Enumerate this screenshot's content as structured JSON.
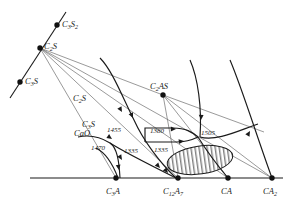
{
  "figure": {
    "type": "phase-diagram",
    "title": "",
    "background": "#ffffff",
    "ink_color": "#1a1a1a",
    "ray_color": "#6f6f6f",
    "size": {
      "width": 287,
      "height": 205
    }
  },
  "points": [
    {
      "id": "c3s2",
      "label": "C",
      "sub1": "3",
      "mid": "S",
      "sub2": "2",
      "x": 57,
      "y": 25,
      "label_x": 62,
      "label_y": 27
    },
    {
      "id": "c2s",
      "label": "C",
      "sub1": "2",
      "mid": "S",
      "sub2": "",
      "x": 40,
      "y": 48,
      "label_x": 44,
      "label_y": 49
    },
    {
      "id": "c3s",
      "label": "C",
      "sub1": "3",
      "mid": "S",
      "sub2": "",
      "x": 20,
      "y": 82,
      "label_x": 25,
      "label_y": 84
    },
    {
      "id": "c2as",
      "label": "C",
      "sub1": "2",
      "mid": "AS",
      "sub2": "",
      "x": 163,
      "y": 95,
      "label_x": 150,
      "label_y": 89
    },
    {
      "id": "c3a",
      "label": "C",
      "sub1": "3",
      "mid": "A",
      "sub2": "",
      "x": 116,
      "y": 178,
      "label_x": 106,
      "label_y": 194
    },
    {
      "id": "c12a7",
      "label": "C",
      "sub1": "12",
      "mid": "A",
      "sub2": "7",
      "x": 178,
      "y": 178,
      "label_x": 163,
      "label_y": 194
    },
    {
      "id": "ca",
      "label": "C",
      "sub1": "",
      "mid": "A",
      "sub2": "",
      "x": 228,
      "y": 178,
      "label_x": 221,
      "label_y": 194
    },
    {
      "id": "ca2",
      "label": "C",
      "sub1": "",
      "mid": "A",
      "sub2": "2",
      "x": 272,
      "y": 178,
      "label_x": 263,
      "label_y": 194
    }
  ],
  "floating_labels": [
    {
      "id": "c2s-field",
      "text": "C2S",
      "base": "C",
      "sub": "2",
      "tail": "S",
      "x": 73,
      "y": 101
    },
    {
      "id": "c3s-field",
      "text": "C3S",
      "base": "C",
      "sub": "3",
      "tail": "S",
      "x": 82,
      "y": 127
    },
    {
      "id": "cao-field",
      "text": "CaO",
      "base": "CaO",
      "sub": "",
      "tail": "",
      "x": 74,
      "y": 136
    }
  ],
  "temperatures": [
    {
      "id": "t1455",
      "value": "1455",
      "x": 107,
      "y": 132
    },
    {
      "id": "t1470",
      "value": "1470",
      "x": 91,
      "y": 150
    },
    {
      "id": "t1335a",
      "value": "1335",
      "x": 124,
      "y": 153
    },
    {
      "id": "t1380",
      "value": "1380",
      "x": 150,
      "y": 133
    },
    {
      "id": "t1335b",
      "value": "1335",
      "x": 154,
      "y": 152
    },
    {
      "id": "t1505",
      "value": "1505",
      "x": 201,
      "y": 135
    }
  ],
  "axis": {
    "id": "baseline",
    "x1": 30,
    "y1": 178,
    "x2": 283,
    "y2": 178
  },
  "hatched_region": {
    "id": "immiscibility-field",
    "cx": 200,
    "cy": 160,
    "rx": 33,
    "ry": 14,
    "rotation": -8,
    "hatch": "vertical"
  },
  "boundary_curves": [
    {
      "id": "curve-cao-left",
      "d": "M 78 137 C 92 134 102 138 110 143 C 117 148 119 160 120 178"
    },
    {
      "id": "curve-1470-branch",
      "d": "M 96 148 C 104 152 112 162 118 178"
    },
    {
      "id": "curve-c2s-down",
      "d": "M 100 58 C 112 70 122 96 134 120 C 143 140 160 163 176 178"
    },
    {
      "id": "curve-c3s-to-c12a7",
      "d": "M 110 143 C 124 152 150 165 176 178"
    },
    {
      "id": "curve-plateau-1380",
      "d": "M 145 142 L 145 128 L 173 128 C 186 128 192 132 198 137"
    },
    {
      "id": "curve-plateau-1335",
      "d": "M 145 142 L 176 142 C 188 142 194 139 198 137"
    },
    {
      "id": "curve-right-upper",
      "d": "M 190 60 C 198 78 202 108 200 137"
    },
    {
      "id": "curve-right-to-ca",
      "d": "M 198 137 C 206 150 218 166 228 178"
    },
    {
      "id": "curve-far-right",
      "d": "M 230 60 C 242 88 258 140 272 178"
    },
    {
      "id": "curve-1505-branch",
      "d": "M 200 137 C 216 142 240 130 258 124"
    }
  ],
  "tie_lines": [
    {
      "id": "tie-c2s-c3a",
      "d": "M 40 48 L 116 178"
    },
    {
      "id": "tie-c2s-c12a7",
      "d": "M 40 48 L 178 178"
    },
    {
      "id": "tie-c2s-ca",
      "d": "M 40 48 L 228 178"
    },
    {
      "id": "tie-c2s-ca2",
      "d": "M 40 48 L 272 178"
    },
    {
      "id": "tie-c2s-c2as",
      "d": "M 40 48 L 163 95"
    },
    {
      "id": "tie-c2as-c12a7",
      "d": "M 163 95 L 178 178"
    },
    {
      "id": "tie-c2as-ca",
      "d": "M 163 95 L 228 178"
    },
    {
      "id": "tie-c2as-ca2",
      "d": "M 163 95 L 272 178"
    },
    {
      "id": "tie-c2as-right",
      "d": "M 163 95 L 264 132"
    },
    {
      "id": "join-c3s-line",
      "d": "M 10 98 L 66 12"
    }
  ],
  "arrows": [
    {
      "id": "arrow-a",
      "x": 122,
      "y": 112,
      "angle": 60
    },
    {
      "id": "arrow-b",
      "x": 133,
      "y": 118,
      "angle": 65
    },
    {
      "id": "arrow-c",
      "x": 122,
      "y": 160,
      "angle": 58
    },
    {
      "id": "arrow-d",
      "x": 119,
      "y": 170,
      "angle": 80
    },
    {
      "id": "arrow-e",
      "x": 160,
      "y": 168,
      "angle": 48
    },
    {
      "id": "arrow-f",
      "x": 168,
      "y": 173,
      "angle": 50
    },
    {
      "id": "arrow-g",
      "x": 176,
      "y": 129,
      "angle": 0
    },
    {
      "id": "arrow-h",
      "x": 184,
      "y": 141,
      "angle": -8
    },
    {
      "id": "arrow-i",
      "x": 201,
      "y": 120,
      "angle": 92
    },
    {
      "id": "arrow-j",
      "x": 250,
      "y": 131,
      "angle": -60
    },
    {
      "id": "arrow-k",
      "x": 112,
      "y": 139,
      "angle": 35
    }
  ]
}
